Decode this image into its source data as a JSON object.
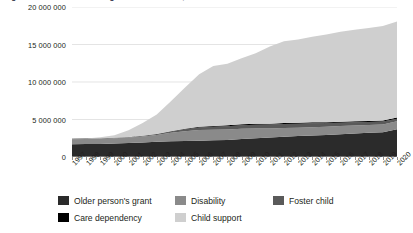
{
  "title": "Figure 1: Number of social grant beneficiaries, 1997-2020",
  "chart_data": {
    "type": "area",
    "title": "Figure 1: Number of social grant beneficiaries, 1997-2020",
    "xlabel": "",
    "ylabel": "",
    "stacked": true,
    "grid": true,
    "legend_position": "bottom",
    "ylim": [
      0,
      20000000
    ],
    "yticks": [
      0,
      5000000,
      10000000,
      15000000,
      20000000
    ],
    "ytick_labels": [
      "0",
      "5 000 000",
      "10 000 000",
      "15 000 000",
      "20 000 000"
    ],
    "categories": [
      "1997",
      "1998",
      "1999",
      "2000",
      "2001",
      "2002",
      "2003",
      "2004",
      "2005",
      "2006",
      "2007",
      "2008",
      "2009",
      "2010",
      "2011",
      "2012",
      "2013",
      "2014",
      "2015",
      "2016",
      "2017",
      "2018",
      "2019",
      "2020"
    ],
    "series": [
      {
        "name": "Older person's grant",
        "color": "#2b2b2b",
        "values": [
          1700000,
          1720000,
          1750000,
          1800000,
          1880000,
          1950000,
          2020000,
          2090000,
          2140000,
          2180000,
          2220000,
          2260000,
          2390000,
          2500000,
          2600000,
          2700000,
          2790000,
          2870000,
          2950000,
          3040000,
          3140000,
          3220000,
          3300000,
          3700000
        ]
      },
      {
        "name": "Disability",
        "color": "#8a8a8a",
        "values": [
          670000,
          680000,
          690000,
          700000,
          720000,
          780000,
          900000,
          1150000,
          1300000,
          1420000,
          1420000,
          1400000,
          1370000,
          1290000,
          1200000,
          1160000,
          1120000,
          1110000,
          1100000,
          1080000,
          1060000,
          1050000,
          1040000,
          1060000
        ]
      },
      {
        "name": "Foster child",
        "color": "#5a5a5a",
        "values": [
          40000,
          42000,
          45000,
          50000,
          60000,
          75000,
          95000,
          130000,
          250000,
          320000,
          400000,
          450000,
          490000,
          510000,
          530000,
          540000,
          530000,
          510000,
          470000,
          440000,
          420000,
          400000,
          380000,
          350000
        ]
      },
      {
        "name": "Care dependency",
        "color": "#000000",
        "values": [
          10000,
          11000,
          12000,
          14000,
          18000,
          25000,
          45000,
          70000,
          90000,
          100000,
          105000,
          110000,
          115000,
          120000,
          120000,
          125000,
          125000,
          128000,
          130000,
          135000,
          140000,
          145000,
          150000,
          155000
        ]
      },
      {
        "name": "Child support",
        "color": "#cfcfcf",
        "values": [
          0,
          30000,
          150000,
          350000,
          900000,
          1700000,
          2600000,
          4000000,
          5500000,
          7000000,
          8000000,
          8200000,
          8800000,
          9400000,
          10300000,
          10900000,
          11100000,
          11400000,
          11700000,
          12000000,
          12200000,
          12400000,
          12600000,
          12800000
        ]
      }
    ]
  },
  "legend": {
    "row1": [
      {
        "label": "Older person's grant",
        "color": "#2b2b2b"
      },
      {
        "label": "Disability",
        "color": "#8a8a8a"
      },
      {
        "label": "Foster child",
        "color": "#5a5a5a"
      }
    ],
    "row2": [
      {
        "label": "Care dependency",
        "color": "#000000"
      },
      {
        "label": "Child support",
        "color": "#cfcfcf"
      }
    ]
  }
}
